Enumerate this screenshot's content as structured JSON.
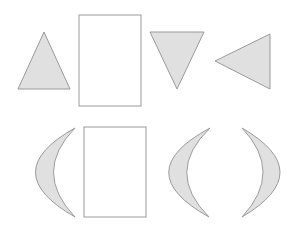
{
  "diagram": {
    "title": "",
    "canvas": {
      "width": 307,
      "height": 251,
      "background": "#ffffff"
    },
    "style": {
      "shape_fill": "#e0e0e0",
      "shape_stroke": "#9a9a9a",
      "rect_fill": "#ffffff",
      "rect_stroke": "#9a9a9a",
      "stroke_width": 1
    },
    "rows": [
      {
        "name": "top-row",
        "shapes": [
          {
            "type": "triangle",
            "orientation": "up",
            "points": "44,32 18,89 70,89"
          },
          {
            "type": "rectangle",
            "x": 79,
            "y": 15,
            "width": 62,
            "height": 91
          },
          {
            "type": "triangle",
            "orientation": "down",
            "points": "150,32 204,32 177,89"
          },
          {
            "type": "triangle",
            "orientation": "left",
            "points": "215,61 270,34 270,89"
          }
        ]
      },
      {
        "name": "bottom-row",
        "shapes": [
          {
            "type": "crescent",
            "orientation": "opens-right",
            "path": "M75,128 Q-4,172 75,217 Q32,172 75,128 Z"
          },
          {
            "type": "rectangle",
            "x": 84,
            "y": 127,
            "width": 62,
            "height": 90
          },
          {
            "type": "crescent",
            "orientation": "opens-right",
            "path": "M210,128 Q128,172 209,217 Q164,172 210,128 Z"
          },
          {
            "type": "crescent",
            "orientation": "opens-left",
            "path": "M242,128 Q318,172 242,217 Q284,172 242,128 Z"
          }
        ]
      }
    ]
  }
}
